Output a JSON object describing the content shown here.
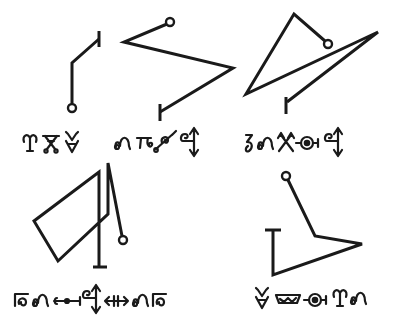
{
  "diagram": {
    "type": "sigil-plate",
    "stroke_color": "#1a1a1a",
    "background_color": "#ffffff",
    "sigils": [
      {
        "id": "sigil-1",
        "start_marker": "circle",
        "end_marker": "bar",
        "points": [
          [
            72,
            103
          ],
          [
            72,
            63
          ],
          [
            99,
            39
          ]
        ],
        "circle": [
          72,
          108
        ],
        "bar": [
          [
            99,
            31
          ],
          [
            99,
            47
          ]
        ],
        "glyphs": [
          "aries-like-glyph",
          "triangle-knot-glyph",
          "cup-fork-glyph"
        ]
      },
      {
        "id": "sigil-2",
        "start_marker": "circle",
        "end_marker": "bar",
        "points": [
          [
            167,
            24
          ],
          [
            124,
            42
          ],
          [
            233,
            68
          ],
          [
            160,
            112
          ]
        ],
        "circle": [
          170,
          22
        ],
        "bar": [
          [
            160,
            104
          ],
          [
            160,
            121
          ]
        ],
        "glyphs": [
          "omega-loop-glyph",
          "pi-hook-glyph",
          "curved-staff-glyph",
          "double-arrow-staff-glyph"
        ]
      },
      {
        "id": "sigil-3",
        "start_marker": "circle",
        "end_marker": "bar",
        "points": [
          [
            325,
            41
          ],
          [
            294,
            14
          ],
          [
            246,
            94
          ],
          [
            378,
            32
          ],
          [
            287,
            102
          ]
        ],
        "circle": [
          328,
          44
        ],
        "bar": [
          [
            286,
            97
          ],
          [
            286,
            114
          ]
        ],
        "glyphs": [
          "zeta-hook-glyph",
          "omega-loop-glyph",
          "crossed-arrows-glyph",
          "circled-dot-bar-glyph",
          "double-arrow-staff-glyph"
        ]
      },
      {
        "id": "sigil-4",
        "start_marker": "circle",
        "end_marker": "bar",
        "points": [
          [
            122,
            236
          ],
          [
            108,
            163
          ],
          [
            108,
            214
          ],
          [
            58,
            261
          ],
          [
            34,
            221
          ],
          [
            99,
            172
          ],
          [
            99,
            267
          ]
        ],
        "circle": [
          123,
          240
        ],
        "bar": [
          [
            93,
            267
          ],
          [
            107,
            267
          ]
        ],
        "glyphs": [
          "boxed-loop-glyph",
          "omega-loop-glyph",
          "dotted-line-glyph",
          "double-arrow-staff-glyph",
          "crossed-bar-arrow-glyph",
          "omega-loop-glyph",
          "boxed-loop-glyph"
        ]
      },
      {
        "id": "sigil-5",
        "start_marker": "circle",
        "end_marker": "bar",
        "points": [
          [
            288,
            180
          ],
          [
            315,
            236
          ],
          [
            362,
            244
          ],
          [
            273,
            275
          ],
          [
            273,
            230
          ]
        ],
        "circle": [
          286,
          176
        ],
        "bar": [
          [
            265,
            230
          ],
          [
            281,
            230
          ]
        ],
        "glyphs": [
          "cup-fork-glyph",
          "wave-trough-glyph",
          "circled-dot-bar-glyph",
          "aries-like-glyph",
          "omega-loop-glyph"
        ]
      }
    ]
  }
}
